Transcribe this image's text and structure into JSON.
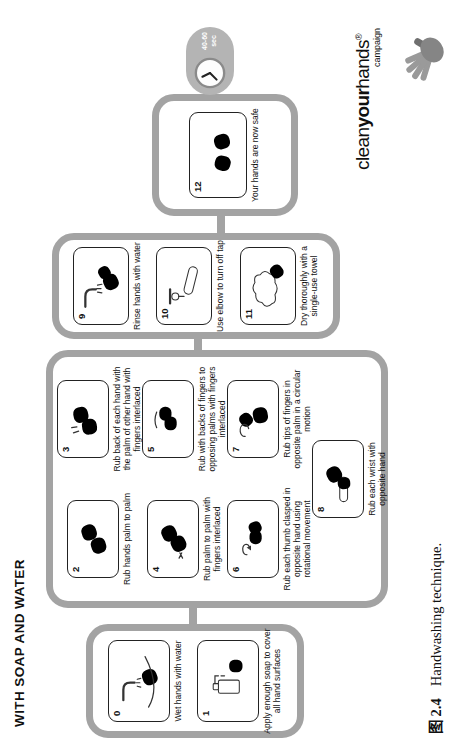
{
  "header": {
    "title": "WITH SOAP AND WATER"
  },
  "timer": {
    "duration_label": "40-60 sec"
  },
  "steps": [
    {
      "num": "0",
      "caption": "Wet hands with water"
    },
    {
      "num": "1",
      "caption": "Apply enough soap to cover all hand surfaces"
    },
    {
      "num": "2",
      "caption": "Rub hands palm to palm"
    },
    {
      "num": "3",
      "caption": "Rub back of each hand with the palm of other hand with fingers interlaced"
    },
    {
      "num": "4",
      "caption": "Rub palm to palm with fingers interlaced"
    },
    {
      "num": "5",
      "caption": "Rub with backs of fingers to opposing palms with fingers interlaced"
    },
    {
      "num": "6",
      "caption": "Rub each thumb clasped in opposite hand using rotational movement"
    },
    {
      "num": "7",
      "caption": "Rub tips of fingers in opposite palm in a circular motion"
    },
    {
      "num": "8",
      "caption": "Rub each wrist with opposite hand"
    },
    {
      "num": "9",
      "caption": "Rinse hands with water"
    },
    {
      "num": "10",
      "caption": "Use elbow to turn off tap"
    },
    {
      "num": "11",
      "caption": "Dry thoroughly with a single-use towel"
    },
    {
      "num": "12",
      "caption": "Your hands are now safe"
    }
  ],
  "logo": {
    "word_clean": "clean",
    "word_your": "your",
    "word_hands": "hands",
    "registered": "®",
    "subtitle": "campaign"
  },
  "figure_caption": {
    "label": "图 2.4",
    "text": "Handwashing technique."
  },
  "colors": {
    "box_border": "#a3a3a3",
    "capsule_gray": "#b4b4b4",
    "ink": "#1a1a1a"
  }
}
